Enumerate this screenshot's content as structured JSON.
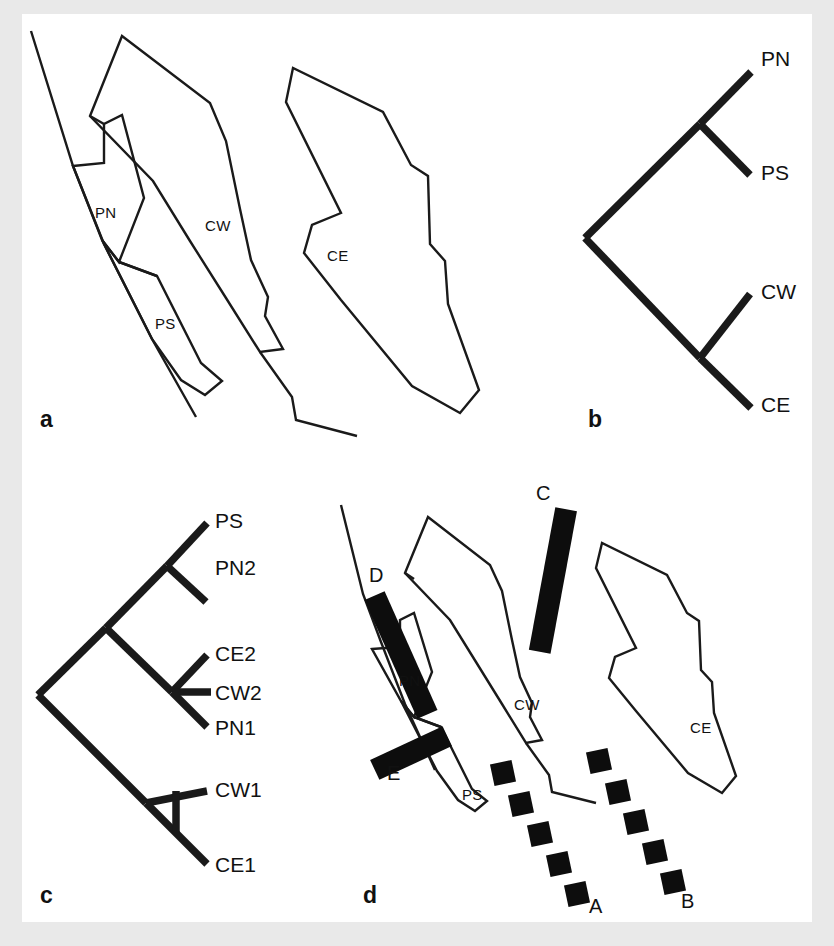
{
  "figure": {
    "background_color": "#e9e9e9",
    "canvas_color": "#ffffff",
    "ink_color": "#1a1a1a"
  },
  "panels": [
    {
      "id": "a",
      "letter": "a",
      "kind": "map"
    },
    {
      "id": "b",
      "letter": "b",
      "kind": "cladogram"
    },
    {
      "id": "c",
      "letter": "c",
      "kind": "cladogram"
    },
    {
      "id": "d",
      "letter": "d",
      "kind": "map-with-barriers"
    }
  ],
  "panel_a": {
    "letter": "a",
    "region_labels": [
      {
        "name": "PN",
        "text": "PN",
        "x": 95,
        "y": 218
      },
      {
        "name": "PS",
        "text": "PS",
        "x": 155,
        "y": 329
      },
      {
        "name": "CW",
        "text": "CW",
        "x": 205,
        "y": 231
      },
      {
        "name": "CE",
        "text": "CE",
        "x": 327,
        "y": 261
      }
    ]
  },
  "panel_b": {
    "letter": "b",
    "tips": [
      {
        "name": "PN",
        "text": "PN",
        "x": 761,
        "y": 66
      },
      {
        "name": "PS",
        "text": "PS",
        "x": 761,
        "y": 180
      },
      {
        "name": "CW",
        "text": "CW",
        "x": 761,
        "y": 299
      },
      {
        "name": "CE",
        "text": "CE",
        "x": 761,
        "y": 412
      }
    ],
    "topology": "((PN,PS),(CW,CE))"
  },
  "panel_c": {
    "letter": "c",
    "tips": [
      {
        "name": "PS",
        "text": "PS",
        "x": 215,
        "y": 528
      },
      {
        "name": "PN2",
        "text": "PN2",
        "x": 215,
        "y": 575
      },
      {
        "name": "CE2",
        "text": "CE2",
        "x": 215,
        "y": 661
      },
      {
        "name": "CW2",
        "text": "CW2",
        "x": 215,
        "y": 692
      },
      {
        "name": "PN1",
        "text": "PN1",
        "x": 215,
        "y": 725
      },
      {
        "name": "CW1",
        "text": "CW1",
        "x": 215,
        "y": 797
      },
      {
        "name": "CE1",
        "text": "CE1",
        "x": 215,
        "y": 869
      }
    ],
    "topology": "(((PS,PN2),(CE2,CW2,PN1)),(CW1,CE1))"
  },
  "panel_d": {
    "letter": "d",
    "region_labels": [
      {
        "name": "PN",
        "text": "PN",
        "x": 399,
        "y": 686
      },
      {
        "name": "PS",
        "text": "PS",
        "x": 462,
        "y": 800
      },
      {
        "name": "CW",
        "text": "CW",
        "x": 514,
        "y": 710
      },
      {
        "name": "CE",
        "text": "CE",
        "x": 690,
        "y": 733
      }
    ],
    "barrier_labels": [
      {
        "name": "A",
        "text": "A",
        "x": 589,
        "y": 913,
        "style": "dashed"
      },
      {
        "name": "B",
        "text": "B",
        "x": 681,
        "y": 908,
        "style": "dashed"
      },
      {
        "name": "C",
        "text": "C",
        "x": 541,
        "y": 500,
        "style": "solid"
      },
      {
        "name": "D",
        "text": "D",
        "x": 371,
        "y": 582,
        "style": "solid"
      },
      {
        "name": "E",
        "text": "E",
        "x": 389,
        "y": 779,
        "style": "solid"
      }
    ],
    "barrier_A_segment_count": 5,
    "barrier_B_segment_count": 5
  }
}
